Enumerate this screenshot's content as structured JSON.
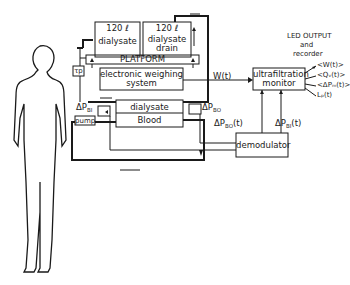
{
  "diagram": {
    "tanks": [
      {
        "volume": "120 ℓ",
        "label": "dialysate"
      },
      {
        "volume": "120 ℓ",
        "label": "dialysate drain"
      }
    ],
    "platform": "PLATFORM",
    "weighing": "electronic weighing system",
    "tp": "τp",
    "dialyzer": {
      "top": "dialysate",
      "bottom": "Blood"
    },
    "pump": "pump",
    "dp_bi_label": "ΔP",
    "dp_bi_sub": "BI",
    "dp_bo_label": "ΔP",
    "dp_bo_sub": "BO",
    "w_signal": "W(t)",
    "monitor": "ultrafiltration monitor",
    "dp_bo_t": "ΔP",
    "dp_bo_t_sub": "BO",
    "dp_bo_t_suffix": "(t)",
    "dp_bi_t": "ΔP",
    "dp_bi_t_sub": "BI",
    "dp_bi_t_suffix": "(t)",
    "demodulator": "demodulator",
    "output_title": "LED OUTPUT",
    "output_and": "and",
    "output_recorder": "recorder",
    "outputs": [
      "<W(t)>",
      "<Qᵥ(t)>",
      "<ΔPₘ(t)>",
      "Lₚ(t)"
    ]
  }
}
